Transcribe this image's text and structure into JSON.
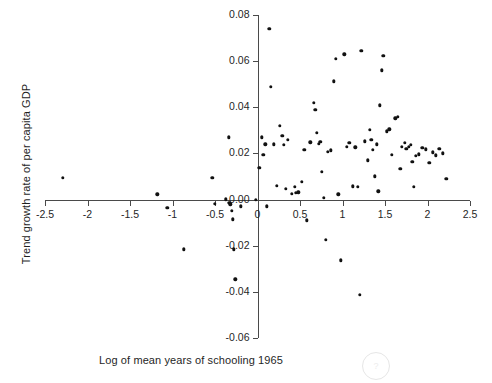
{
  "chart_data": {
    "type": "scatter",
    "title": "",
    "xlabel": "Log of mean years of schooling 1965",
    "ylabel": "Trend growth rate of per capita GDP",
    "xlim": [
      -2.5,
      2.5
    ],
    "ylim": [
      -0.06,
      0.08
    ],
    "xticks": [
      -2.5,
      -2,
      -1.5,
      -1,
      -0.5,
      0,
      0.5,
      1,
      1.5,
      2,
      2.5
    ],
    "xtick_labels": [
      "-2.5",
      "-2",
      "-1.5",
      "-1",
      "-0.5",
      "0",
      "0.5",
      "1",
      "1.5",
      "2",
      "2.5"
    ],
    "yticks": [
      -0.06,
      -0.04,
      -0.02,
      0.0,
      0.02,
      0.04,
      0.06,
      0.08
    ],
    "ytick_labels": [
      "-0.06",
      "-0.04",
      "-0.02",
      "0.00",
      "0.02",
      "0.04",
      "0.06",
      "0.08"
    ],
    "grid": false,
    "legend": null,
    "marker": {
      "shape": "circle",
      "color": "#111111",
      "size": 3.4
    },
    "axis_color": "#4a4a4a",
    "x_axis_at_y": 0.0,
    "y_axis_at_x": 0.0,
    "points": [
      [
        -2.29,
        0.0095
      ],
      [
        -1.18,
        0.0023
      ],
      [
        -1.06,
        -0.0035
      ],
      [
        -0.87,
        -0.0215
      ],
      [
        -0.53,
        0.0095
      ],
      [
        -0.5,
        -0.0018
      ],
      [
        -0.37,
        0.0002
      ],
      [
        -0.34,
        0.027
      ],
      [
        -0.33,
        -0.0015
      ],
      [
        -0.32,
        -0.002
      ],
      [
        -0.3,
        -0.005
      ],
      [
        -0.29,
        -0.0085
      ],
      [
        -0.28,
        -0.0215
      ],
      [
        -0.26,
        -0.0345
      ],
      [
        -0.2,
        -0.003
      ],
      [
        -0.02,
        0.0
      ],
      [
        0.02,
        0.0137
      ],
      [
        0.05,
        0.027
      ],
      [
        0.07,
        0.0193
      ],
      [
        0.09,
        0.024
      ],
      [
        0.11,
        -0.003
      ],
      [
        0.14,
        0.074
      ],
      [
        0.16,
        0.049
      ],
      [
        0.19,
        0.024
      ],
      [
        0.23,
        0.0059
      ],
      [
        0.26,
        0.032
      ],
      [
        0.29,
        0.0276
      ],
      [
        0.31,
        0.0237
      ],
      [
        0.33,
        0.0046
      ],
      [
        0.36,
        0.026
      ],
      [
        0.4,
        0.0025
      ],
      [
        0.44,
        0.0056
      ],
      [
        0.45,
        0.0029
      ],
      [
        0.48,
        0.0031
      ],
      [
        0.52,
        0.0076
      ],
      [
        0.55,
        0.0216
      ],
      [
        0.58,
        -0.009
      ],
      [
        0.62,
        0.0248
      ],
      [
        0.66,
        0.042
      ],
      [
        0.68,
        0.0388
      ],
      [
        0.7,
        0.029
      ],
      [
        0.72,
        0.0243
      ],
      [
        0.74,
        0.025
      ],
      [
        0.76,
        0.012
      ],
      [
        0.78,
        0.0007
      ],
      [
        0.8,
        -0.0175
      ],
      [
        0.83,
        0.0206
      ],
      [
        0.86,
        0.0213
      ],
      [
        0.9,
        0.0512
      ],
      [
        0.92,
        0.0609
      ],
      [
        0.95,
        0.0023
      ],
      [
        0.98,
        -0.0264
      ],
      [
        1.02,
        0.063
      ],
      [
        1.05,
        0.0228
      ],
      [
        1.08,
        0.0246
      ],
      [
        1.12,
        0.0058
      ],
      [
        1.15,
        0.0227
      ],
      [
        1.18,
        0.0055
      ],
      [
        1.2,
        -0.0412
      ],
      [
        1.22,
        0.0645
      ],
      [
        1.26,
        0.0253
      ],
      [
        1.3,
        0.017
      ],
      [
        1.32,
        0.0302
      ],
      [
        1.34,
        0.0258
      ],
      [
        1.36,
        0.0215
      ],
      [
        1.38,
        0.0101
      ],
      [
        1.4,
        0.024
      ],
      [
        1.42,
        0.0035
      ],
      [
        1.44,
        0.0409
      ],
      [
        1.46,
        0.056
      ],
      [
        1.48,
        0.0624
      ],
      [
        1.52,
        0.0296
      ],
      [
        1.55,
        0.0304
      ],
      [
        1.58,
        0.0194
      ],
      [
        1.62,
        0.0352
      ],
      [
        1.65,
        0.0358
      ],
      [
        1.68,
        0.0133
      ],
      [
        1.7,
        0.023
      ],
      [
        1.73,
        0.0245
      ],
      [
        1.75,
        0.022
      ],
      [
        1.78,
        0.0228
      ],
      [
        1.8,
        0.0238
      ],
      [
        1.82,
        0.0165
      ],
      [
        1.84,
        0.0056
      ],
      [
        1.86,
        0.0189
      ],
      [
        1.9,
        0.0196
      ],
      [
        1.94,
        0.0225
      ],
      [
        1.98,
        0.0218
      ],
      [
        2.02,
        0.016
      ],
      [
        2.06,
        0.0205
      ],
      [
        2.1,
        0.0192
      ],
      [
        2.14,
        0.0219
      ],
      [
        2.18,
        0.02
      ],
      [
        2.22,
        0.009
      ]
    ]
  },
  "watermark": {
    "glyph": "?"
  }
}
